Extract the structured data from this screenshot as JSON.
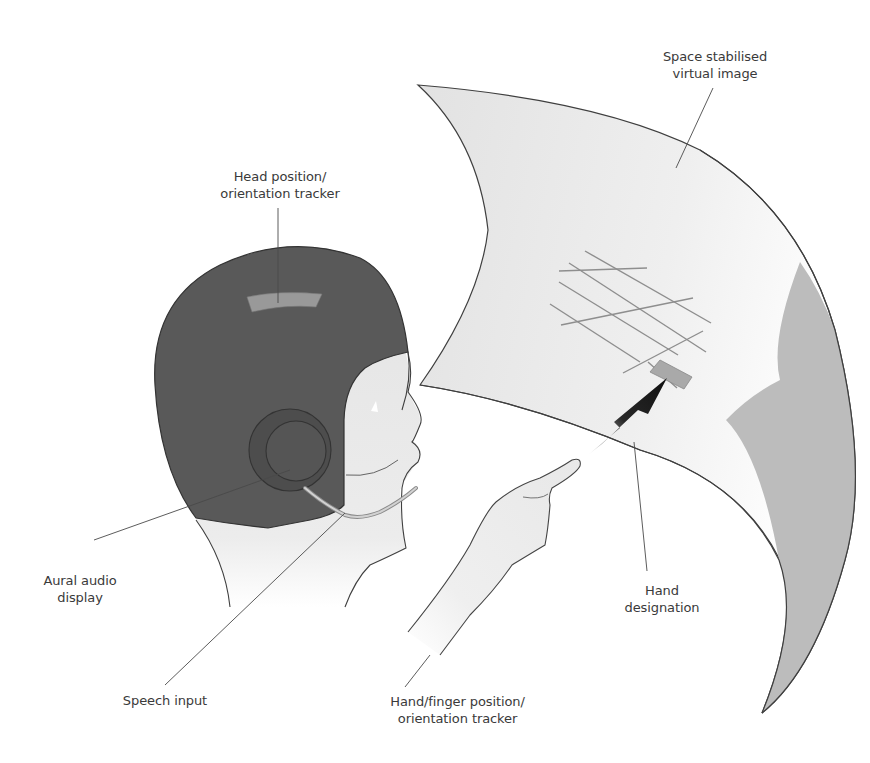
{
  "diagram": {
    "colors": {
      "helmet": "#5a5a5a",
      "helmet_stroke": "#3a3a3a",
      "tracker_pad": "#9a9a9a",
      "skin": "#ebebeb",
      "screen": "#e6e6e6",
      "screen_shadow": "#b9b9b9",
      "grid": "#8e8e8e",
      "designation_box": "#a9a9a9",
      "arrow": "#111111",
      "leader": "#4a4a4a",
      "text": "#3a3a3a"
    },
    "labels": {
      "virtual_image": {
        "line1": "Space stabilised",
        "line2": "virtual image"
      },
      "head_tracker": {
        "line1": "Head position/",
        "line2": "orientation tracker"
      },
      "aural_display": {
        "line1": "Aural audio",
        "line2": "display"
      },
      "speech_input": {
        "line1": "Speech input"
      },
      "hand_tracker": {
        "line1": "Hand/finger position/",
        "line2": "orientation tracker"
      },
      "hand_designation": {
        "line1": "Hand",
        "line2": "designation"
      }
    }
  }
}
